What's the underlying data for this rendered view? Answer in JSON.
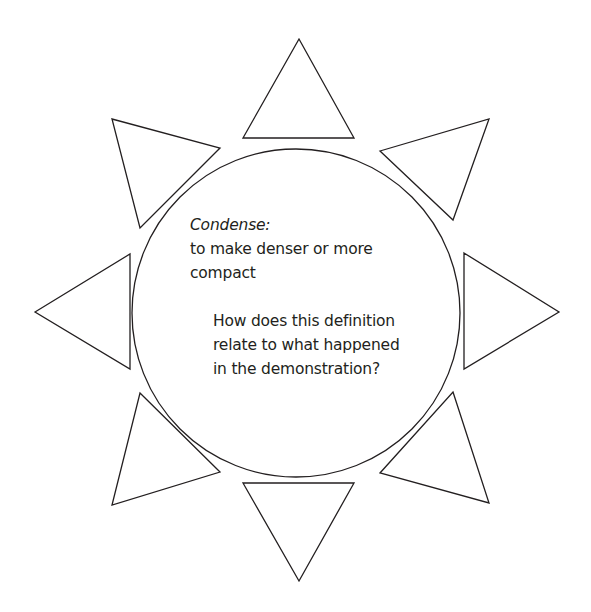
{
  "diagram": {
    "type": "sun-graphic-organizer",
    "center_circle": {
      "cx": 296,
      "cy": 313,
      "r": 164
    },
    "triangles": [
      {
        "position": "top",
        "points": "299,39 243,138 354,138"
      },
      {
        "position": "top-right",
        "points": "380,151 489,119 453,220"
      },
      {
        "position": "right",
        "points": "464,253 559,312 464,369"
      },
      {
        "position": "bottom-right",
        "points": "453,392 489,503 380,473"
      },
      {
        "position": "bottom",
        "points": "243,483 354,483 299,581"
      },
      {
        "position": "bottom-left",
        "points": "140,393 220,472 112,505"
      },
      {
        "position": "left",
        "points": "35,312 130,254 130,369"
      },
      {
        "position": "top-left",
        "points": "112,119 220,148 140,228"
      }
    ],
    "stroke_color": "#231f20",
    "fill_color": "#ffffff"
  },
  "content": {
    "term": "Condense:",
    "definition": "to make denser or more compact",
    "question": "How does this definition relate to what happened in the demonstration?"
  }
}
